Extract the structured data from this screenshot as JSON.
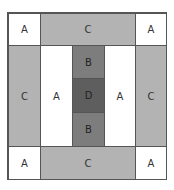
{
  "diagram": {
    "colors": {
      "A": "#ffffff",
      "B": "#7d7d7d",
      "C": "#b3b3b3",
      "D": "#5e5e5e"
    },
    "cells": {
      "top_left": "A",
      "top_center": "C",
      "top_right": "A",
      "left_side": "C",
      "inner_left": "A",
      "center_top": "B",
      "center": "D",
      "center_bottom": "B",
      "inner_right": "A",
      "right_side": "C",
      "bottom_left": "A",
      "bottom_center": "C",
      "bottom_right": "A"
    }
  }
}
